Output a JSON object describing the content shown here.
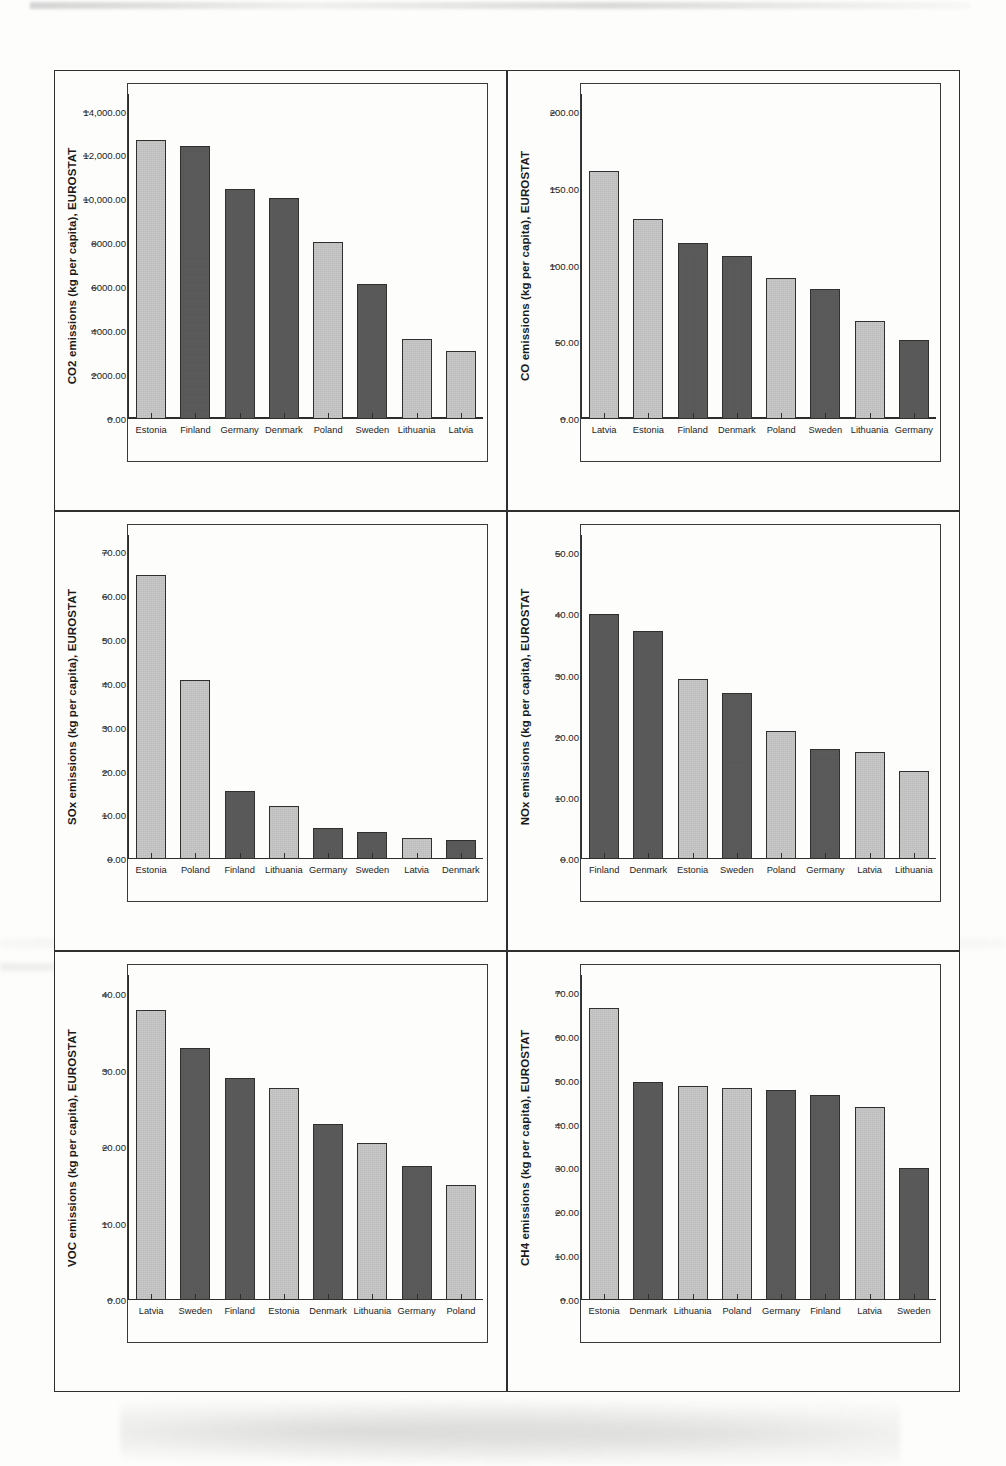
{
  "chart_data": [
    {
      "id": "co2",
      "type": "bar",
      "title": "",
      "xlabel": "",
      "ylabel": "CO2 emissions (kg per capita), EUROSTAT",
      "ylim": [
        0,
        14800
      ],
      "yticks": [
        0,
        2000,
        4000,
        6000,
        8000,
        10000,
        12000,
        14000
      ],
      "ytick_labels": [
        "0.00",
        "2000.00",
        "4000.00",
        "6000.00",
        "8000.00",
        "10,000.00",
        "12,000.00",
        "14,000.00"
      ],
      "grid": false,
      "legend": "none",
      "categories": [
        "Estonia",
        "Finland",
        "Germany",
        "Denmark",
        "Poland",
        "Sweden",
        "Lithuania",
        "Latvia"
      ],
      "values": [
        12700,
        12450,
        10450,
        10080,
        8060,
        6120,
        3620,
        3100
      ],
      "shades": [
        "light",
        "dark",
        "dark",
        "dark",
        "light",
        "dark",
        "light",
        "light"
      ]
    },
    {
      "id": "co",
      "type": "bar",
      "title": "",
      "xlabel": "",
      "ylabel": "CO emissions (kg per capita), EUROSTAT",
      "ylim": [
        0,
        212
      ],
      "yticks": [
        0,
        50,
        100,
        150,
        200
      ],
      "ytick_labels": [
        "0.00",
        "50.00",
        "100.00",
        "150.00",
        "200.00"
      ],
      "grid": false,
      "legend": "none",
      "categories": [
        "Latvia",
        "Estonia",
        "Finland",
        "Denmark",
        "Poland",
        "Sweden",
        "Lithuania",
        "Germany"
      ],
      "values": [
        161.5,
        130.5,
        115.0,
        106.5,
        92.0,
        85.0,
        63.5,
        51.5
      ],
      "shades": [
        "light",
        "light",
        "dark",
        "dark",
        "light",
        "dark",
        "light",
        "dark"
      ]
    },
    {
      "id": "sox",
      "type": "bar",
      "title": "",
      "xlabel": "",
      "ylabel": "SOx emissions (kg per capita), EUROSTAT",
      "ylim": [
        0,
        74
      ],
      "yticks": [
        0,
        10,
        20,
        30,
        40,
        50,
        60,
        70
      ],
      "ytick_labels": [
        "0.00",
        "10.00",
        "20.00",
        "30.00",
        "40.00",
        "50.00",
        "60.00",
        "70.00"
      ],
      "grid": false,
      "legend": "none",
      "categories": [
        "Estonia",
        "Poland",
        "Finland",
        "Lithuania",
        "Germany",
        "Sweden",
        "Latvia",
        "Denmark"
      ],
      "values": [
        64.7,
        40.8,
        15.6,
        12.1,
        7.2,
        6.2,
        4.9,
        4.5
      ],
      "shades": [
        "light",
        "light",
        "dark",
        "light",
        "dark",
        "dark",
        "light",
        "dark"
      ]
    },
    {
      "id": "nox",
      "type": "bar",
      "title": "",
      "xlabel": "",
      "ylabel": "NOx emissions (kg per capita), EUROSTAT",
      "ylim": [
        0,
        53
      ],
      "yticks": [
        0,
        10,
        20,
        30,
        40,
        50
      ],
      "ytick_labels": [
        "0.00",
        "10.00",
        "20.00",
        "30.00",
        "40.00",
        "50.00"
      ],
      "grid": false,
      "legend": "none",
      "categories": [
        "Finland",
        "Denmark",
        "Estonia",
        "Sweden",
        "Poland",
        "Germany",
        "Latvia",
        "Lithuania"
      ],
      "values": [
        40.1,
        37.2,
        29.5,
        27.2,
        21.0,
        18.0,
        17.5,
        14.5
      ],
      "shades": [
        "dark",
        "dark",
        "light",
        "dark",
        "light",
        "dark",
        "light",
        "light"
      ]
    },
    {
      "id": "voc",
      "type": "bar",
      "title": "",
      "xlabel": "",
      "ylabel": "VOC emissions (kg per capita), EUROSTAT",
      "ylim": [
        0,
        42.5
      ],
      "yticks": [
        0,
        10,
        20,
        30,
        40
      ],
      "ytick_labels": [
        "0.00",
        "10.00",
        "20.00",
        "30.00",
        "40.00"
      ],
      "grid": false,
      "legend": "none",
      "categories": [
        "Latvia",
        "Sweden",
        "Finland",
        "Estonia",
        "Denmark",
        "Lithuania",
        "Germany",
        "Poland"
      ],
      "values": [
        37.9,
        33.0,
        29.0,
        27.7,
        23.0,
        20.6,
        17.6,
        15.0
      ],
      "shades": [
        "light",
        "dark",
        "dark",
        "light",
        "dark",
        "light",
        "dark",
        "light"
      ]
    },
    {
      "id": "ch4",
      "type": "bar",
      "title": "",
      "xlabel": "",
      "ylabel": "CH4 emissions (kg per capita), EUROSTAT",
      "ylim": [
        0,
        74
      ],
      "yticks": [
        0,
        10,
        20,
        30,
        40,
        50,
        60,
        70
      ],
      "ytick_labels": [
        "0.00",
        "10.00",
        "20.00",
        "30.00",
        "40.00",
        "50.00",
        "60.00",
        "70.00"
      ],
      "grid": false,
      "legend": "none",
      "categories": [
        "Estonia",
        "Denmark",
        "Lithuania",
        "Poland",
        "Germany",
        "Finland",
        "Latvia",
        "Sweden"
      ],
      "values": [
        66.6,
        49.8,
        48.7,
        48.3,
        47.8,
        46.7,
        44.0,
        30.2
      ],
      "shades": [
        "light",
        "dark",
        "light",
        "light",
        "dark",
        "dark",
        "light",
        "dark"
      ]
    }
  ],
  "colors": {
    "bar_light": "#c9c9c9",
    "bar_dark": "#5c5c5c",
    "axis": "#2d2d2d",
    "panel_border": "#2f2f2f",
    "page_background": "#fdfdfc"
  }
}
